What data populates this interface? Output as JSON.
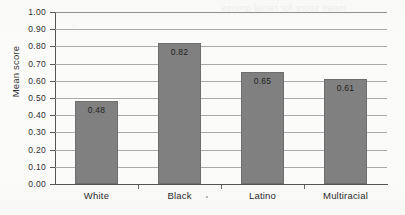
{
  "chart_data": {
    "type": "bar",
    "title": "",
    "xlabel": "",
    "ylabel": "Mean score",
    "categories": [
      "White",
      "Black",
      "Latino",
      "Multiracial"
    ],
    "values": [
      0.48,
      0.82,
      0.65,
      0.61
    ],
    "value_labels": [
      "0.48",
      "0.82",
      "0.65",
      "0.61"
    ],
    "ylim": [
      0.0,
      1.0
    ],
    "ytick_step": 0.1,
    "ytick_labels": [
      "1.00",
      "0.90",
      "0.80",
      "0.70",
      "0.60",
      "0.50",
      "0.40",
      "0.30",
      "0.20",
      "0.10",
      "0.00"
    ],
    "ytick_values": [
      1.0,
      0.9,
      0.8,
      0.7,
      0.6,
      0.5,
      0.4,
      0.3,
      0.2,
      0.1,
      0.0
    ],
    "grid": true,
    "grid_orientation": "horizontal",
    "legend": false,
    "legend_position": "none",
    "bar_color": "#808080",
    "bar_edge_color": "#6e6e6e",
    "grid_color": "#9a9a9a",
    "axis_color": "#555555",
    "background_color": "#fbfbfa",
    "text_color": "#2b2b2b",
    "value_label_position": "inside-top"
  },
  "artifacts": {
    "bleed_through_text": "mean score for racial groups"
  }
}
